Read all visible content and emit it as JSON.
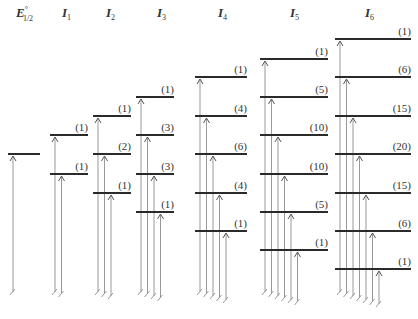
{
  "diagram": {
    "title": "",
    "columns": [
      {
        "header": "E",
        "sup": "°",
        "sub": "1/2",
        "header_x": 16,
        "x1": 8,
        "x2": 40,
        "levels": [
          {
            "y": 154,
            "mult": ""
          }
        ]
      },
      {
        "header": "I",
        "sub": "1",
        "header_x": 62,
        "x1": 50,
        "x2": 88,
        "levels": [
          {
            "y": 135,
            "mult": "(1)"
          },
          {
            "y": 174,
            "mult": "(1)"
          }
        ]
      },
      {
        "header": "I",
        "sub": "2",
        "header_x": 106,
        "x1": 93,
        "x2": 131,
        "levels": [
          {
            "y": 116,
            "mult": "(1)"
          },
          {
            "y": 154,
            "mult": "(2)"
          },
          {
            "y": 193,
            "mult": "(1)"
          }
        ]
      },
      {
        "header": "I",
        "sub": "3",
        "header_x": 157,
        "x1": 136,
        "x2": 174,
        "levels": [
          {
            "y": 97,
            "mult": "(1)"
          },
          {
            "y": 135,
            "mult": "(3)"
          },
          {
            "y": 174,
            "mult": "(3)"
          },
          {
            "y": 212,
            "mult": "(1)"
          }
        ]
      },
      {
        "header": "I",
        "sub": "4",
        "header_x": 218,
        "x1": 195,
        "x2": 247,
        "levels": [
          {
            "y": 77,
            "mult": "(1)"
          },
          {
            "y": 116,
            "mult": "(4)"
          },
          {
            "y": 154,
            "mult": "(6)"
          },
          {
            "y": 193,
            "mult": "(4)"
          },
          {
            "y": 231,
            "mult": "(1)"
          }
        ]
      },
      {
        "header": "I",
        "sub": "5",
        "header_x": 290,
        "x1": 260,
        "x2": 328,
        "levels": [
          {
            "y": 59,
            "mult": "(1)"
          },
          {
            "y": 97,
            "mult": "(5)"
          },
          {
            "y": 135,
            "mult": "(10)"
          },
          {
            "y": 174,
            "mult": "(10)"
          },
          {
            "y": 212,
            "mult": "(5)"
          },
          {
            "y": 250,
            "mult": "(1)"
          }
        ]
      },
      {
        "header": "I",
        "sub": "6",
        "header_x": 365,
        "x1": 335,
        "x2": 411,
        "levels": [
          {
            "y": 39,
            "mult": "(1)"
          },
          {
            "y": 77,
            "mult": "(6)"
          },
          {
            "y": 116,
            "mult": "(15)"
          },
          {
            "y": 154,
            "mult": "(20)"
          },
          {
            "y": 193,
            "mult": "(15)"
          },
          {
            "y": 231,
            "mult": "(6)"
          },
          {
            "y": 269,
            "mult": "(1)"
          }
        ]
      }
    ],
    "colors": {
      "level": "#2a2a2a",
      "transition": "#999999",
      "text": "#333333"
    }
  }
}
